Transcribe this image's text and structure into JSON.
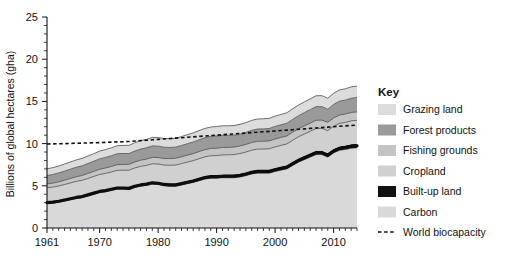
{
  "chart_data": {
    "type": "area",
    "title": "",
    "xlabel": "",
    "ylabel": "Billions of global hectares (gha)",
    "xlim": [
      1961,
      2014
    ],
    "ylim": [
      0,
      25
    ],
    "ytick_step": 5,
    "ytick_minor_step": 1,
    "grid": false,
    "legend_position": "right",
    "x": [
      1961,
      1962,
      1963,
      1964,
      1965,
      1966,
      1967,
      1968,
      1969,
      1970,
      1971,
      1972,
      1973,
      1974,
      1975,
      1976,
      1977,
      1978,
      1979,
      1980,
      1981,
      1982,
      1983,
      1984,
      1985,
      1986,
      1987,
      1988,
      1989,
      1990,
      1991,
      1992,
      1993,
      1994,
      1995,
      1996,
      1997,
      1998,
      1999,
      2000,
      2001,
      2002,
      2003,
      2004,
      2005,
      2006,
      2007,
      2008,
      2009,
      2010,
      2011,
      2012,
      2013,
      2014
    ],
    "xtick_labels": [
      "1961",
      "1970",
      "1980",
      "1990",
      "2000",
      "2010"
    ],
    "xtick_values": [
      1961,
      1970,
      1980,
      1990,
      2000,
      2010
    ],
    "ytick_labels": [
      "0",
      "5",
      "10",
      "15",
      "20",
      "25"
    ],
    "ytick_values": [
      0,
      5,
      10,
      15,
      20,
      25
    ],
    "stack_order_bottom_to_top": [
      "Carbon",
      "Built-up land",
      "Cropland",
      "Fishing grounds",
      "Forest products",
      "Grazing land"
    ],
    "series": [
      {
        "name": "Carbon",
        "color": "#d9d9d9",
        "values": [
          2.9,
          2.95,
          3.05,
          3.2,
          3.35,
          3.5,
          3.6,
          3.8,
          4.0,
          4.2,
          4.3,
          4.45,
          4.6,
          4.6,
          4.55,
          4.8,
          4.95,
          5.05,
          5.2,
          5.15,
          5.0,
          4.95,
          4.95,
          5.1,
          5.25,
          5.4,
          5.6,
          5.8,
          5.9,
          5.9,
          5.95,
          5.95,
          5.95,
          6.05,
          6.2,
          6.4,
          6.5,
          6.5,
          6.5,
          6.7,
          6.85,
          7.0,
          7.4,
          7.8,
          8.1,
          8.4,
          8.7,
          8.7,
          8.4,
          8.9,
          9.2,
          9.3,
          9.45,
          9.5
        ]
      },
      {
        "name": "Built-up land",
        "color": "#111111",
        "values": [
          0.22,
          0.22,
          0.23,
          0.23,
          0.24,
          0.24,
          0.25,
          0.25,
          0.26,
          0.26,
          0.27,
          0.27,
          0.28,
          0.28,
          0.29,
          0.29,
          0.3,
          0.3,
          0.31,
          0.31,
          0.32,
          0.32,
          0.33,
          0.33,
          0.34,
          0.34,
          0.35,
          0.35,
          0.36,
          0.36,
          0.37,
          0.37,
          0.38,
          0.38,
          0.39,
          0.39,
          0.4,
          0.4,
          0.41,
          0.41,
          0.42,
          0.42,
          0.43,
          0.43,
          0.44,
          0.44,
          0.45,
          0.45,
          0.46,
          0.46,
          0.47,
          0.47,
          0.48,
          0.48
        ]
      },
      {
        "name": "Cropland",
        "color": "#d0d0d0",
        "values": [
          1.65,
          1.68,
          1.7,
          1.72,
          1.75,
          1.78,
          1.8,
          1.82,
          1.85,
          1.88,
          1.9,
          1.92,
          1.95,
          1.97,
          2.0,
          2.02,
          2.05,
          2.07,
          2.1,
          2.12,
          2.14,
          2.16,
          2.18,
          2.2,
          2.22,
          2.24,
          2.26,
          2.28,
          2.3,
          2.32,
          2.34,
          2.35,
          2.37,
          2.39,
          2.41,
          2.43,
          2.45,
          2.46,
          2.48,
          2.5,
          2.52,
          2.54,
          2.56,
          2.58,
          2.6,
          2.62,
          2.64,
          2.66,
          2.68,
          2.7,
          2.72,
          2.74,
          2.76,
          2.78
        ]
      },
      {
        "name": "Fishing grounds",
        "color": "#c4c4c4",
        "values": [
          0.45,
          0.47,
          0.49,
          0.51,
          0.53,
          0.55,
          0.57,
          0.59,
          0.6,
          0.62,
          0.64,
          0.65,
          0.67,
          0.68,
          0.7,
          0.71,
          0.73,
          0.74,
          0.76,
          0.77,
          0.78,
          0.79,
          0.8,
          0.81,
          0.82,
          0.83,
          0.84,
          0.85,
          0.86,
          0.87,
          0.88,
          0.88,
          0.89,
          0.9,
          0.9,
          0.91,
          0.92,
          0.92,
          0.93,
          0.93,
          0.94,
          0.94,
          0.95,
          0.95,
          0.96,
          0.96,
          0.97,
          0.97,
          0.98,
          0.98,
          0.99,
          0.99,
          1.0,
          1.0
        ]
      },
      {
        "name": "Forest products",
        "color": "#9a9a9a",
        "values": [
          1.0,
          1.02,
          1.05,
          1.08,
          1.1,
          1.13,
          1.15,
          1.18,
          1.2,
          1.23,
          1.25,
          1.27,
          1.3,
          1.3,
          1.28,
          1.3,
          1.32,
          1.34,
          1.36,
          1.35,
          1.33,
          1.32,
          1.32,
          1.34,
          1.36,
          1.38,
          1.4,
          1.42,
          1.44,
          1.45,
          1.44,
          1.42,
          1.4,
          1.4,
          1.42,
          1.44,
          1.46,
          1.46,
          1.47,
          1.5,
          1.5,
          1.51,
          1.53,
          1.55,
          1.57,
          1.6,
          1.62,
          1.6,
          1.55,
          1.6,
          1.65,
          1.65,
          1.68,
          1.7
        ]
      },
      {
        "name": "Grazing land",
        "color": "#dcdcdc",
        "values": [
          0.8,
          0.81,
          0.82,
          0.84,
          0.85,
          0.86,
          0.88,
          0.89,
          0.9,
          0.92,
          0.93,
          0.94,
          0.95,
          0.96,
          0.97,
          0.98,
          0.99,
          1.0,
          1.01,
          1.02,
          1.03,
          1.04,
          1.05,
          1.06,
          1.07,
          1.08,
          1.09,
          1.1,
          1.11,
          1.12,
          1.13,
          1.14,
          1.15,
          1.16,
          1.17,
          1.18,
          1.19,
          1.2,
          1.21,
          1.22,
          1.23,
          1.24,
          1.25,
          1.26,
          1.27,
          1.28,
          1.29,
          1.3,
          1.31,
          1.32,
          1.33,
          1.34,
          1.35,
          1.36
        ]
      }
    ],
    "reference_line": {
      "name": "World biocapacity",
      "style": "dashed",
      "color": "#111111",
      "values": [
        9.95,
        9.97,
        9.99,
        10.0,
        10.02,
        10.04,
        10.06,
        10.08,
        10.1,
        10.12,
        10.15,
        10.18,
        10.2,
        10.22,
        10.25,
        10.3,
        10.35,
        10.4,
        10.45,
        10.5,
        10.55,
        10.6,
        10.65,
        10.7,
        10.75,
        10.8,
        10.85,
        10.9,
        10.95,
        11.0,
        11.05,
        11.1,
        11.15,
        11.2,
        11.25,
        11.3,
        11.35,
        11.4,
        11.45,
        11.5,
        11.55,
        11.6,
        11.65,
        11.7,
        11.75,
        11.8,
        11.85,
        11.9,
        11.95,
        12.0,
        12.05,
        12.1,
        12.15,
        12.2
      ]
    },
    "totals": [
      7.02,
      7.15,
      7.34,
      7.58,
      7.82,
      8.06,
      8.25,
      8.53,
      8.81,
      9.11,
      9.29,
      9.5,
      9.75,
      9.74,
      9.79,
      10.1,
      10.34,
      10.5,
      10.74,
      10.72,
      10.6,
      10.58,
      10.63,
      10.84,
      11.06,
      11.27,
      11.54,
      11.8,
      11.97,
      12.02,
      12.11,
      12.11,
      12.14,
      12.28,
      12.49,
      12.75,
      12.92,
      12.94,
      13.0,
      13.26,
      13.46,
      13.65,
      14.07,
      14.47,
      14.84,
      15.2,
      15.57,
      15.58,
      15.28,
      15.86,
      16.36,
      16.49,
      16.72,
      16.82
    ]
  },
  "legend": {
    "title": "Key",
    "items": [
      {
        "label": "Grazing land",
        "color": "#dcdcdc",
        "type": "swatch"
      },
      {
        "label": "Forest products",
        "color": "#9a9a9a",
        "type": "swatch"
      },
      {
        "label": "Fishing grounds",
        "color": "#c4c4c4",
        "type": "swatch"
      },
      {
        "label": "Cropland",
        "color": "#d0d0d0",
        "type": "swatch"
      },
      {
        "label": "Built-up land",
        "color": "#111111",
        "type": "swatch"
      },
      {
        "label": "Carbon",
        "color": "#d9d9d9",
        "type": "swatch"
      },
      {
        "label": "World biocapacity",
        "color": "#111111",
        "type": "dashed-line"
      }
    ]
  }
}
